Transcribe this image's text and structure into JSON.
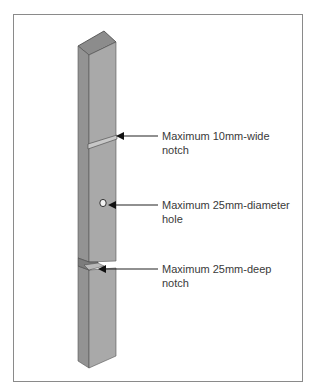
{
  "diagram": {
    "colors": {
      "front_face": "#a9a9a9",
      "side_face": "#939393",
      "top_face": "#8c8c8c",
      "outline": "#444444",
      "arrow": "#222222",
      "text": "#3a3a3a",
      "frame": "#8a8a8a"
    },
    "annotations": [
      {
        "id": "notch-wide",
        "line1": "Maximum 10mm-wide",
        "line2": "notch"
      },
      {
        "id": "hole",
        "line1": "Maximum 25mm-diameter",
        "line2": "hole"
      },
      {
        "id": "notch-deep",
        "line1": "Maximum 25mm-deep",
        "line2": "notch"
      }
    ]
  }
}
